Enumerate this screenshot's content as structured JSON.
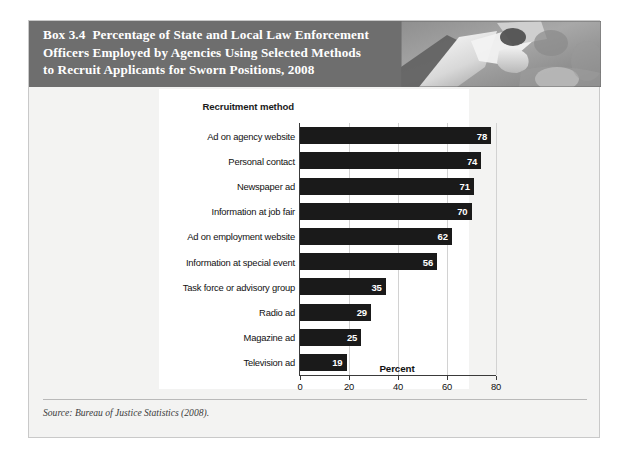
{
  "box": {
    "label": "Box 3.4",
    "title": "Percentage of State and Local Law Enforcement Officers Employed by Agencies Using Selected Methods to Recruit Applicants for Sworn Positions, 2008",
    "title_line1": "Percentage of State and Local Law Enforcement",
    "title_line2": "Officers Employed by Agencies Using Selected Methods",
    "title_line3": "to Recruit Applicants for Sworn Positions, 2008",
    "source": "Source: Bureau of Justice Statistics (2008).",
    "header_bg": "#6e6e6e",
    "bar_color": "#1a1a1a",
    "panel_bg": "#ffffff",
    "page_bg": "#f3f3f2"
  },
  "chart_data": {
    "type": "bar",
    "orientation": "horizontal",
    "title": "",
    "category_axis_title": "Recruitment method",
    "xlabel": "Percent",
    "ylabel": "",
    "xlim": [
      0,
      80
    ],
    "xticks": [
      0,
      20,
      40,
      60,
      80
    ],
    "grid": true,
    "grid_axis": "x",
    "legend": "none",
    "data_labels": true,
    "categories": [
      "Ad on agency website",
      "Personal contact",
      "Newspaper ad",
      "Information at job fair",
      "Ad on employment website",
      "Information at special event",
      "Task force or advisory group",
      "Radio ad",
      "Magazine ad",
      "Television ad"
    ],
    "values": [
      78,
      74,
      71,
      70,
      62,
      56,
      35,
      29,
      25,
      19
    ],
    "series": [
      {
        "name": "Percent of officers",
        "values": [
          78,
          74,
          71,
          70,
          62,
          56,
          35,
          29,
          25,
          19
        ]
      }
    ]
  }
}
